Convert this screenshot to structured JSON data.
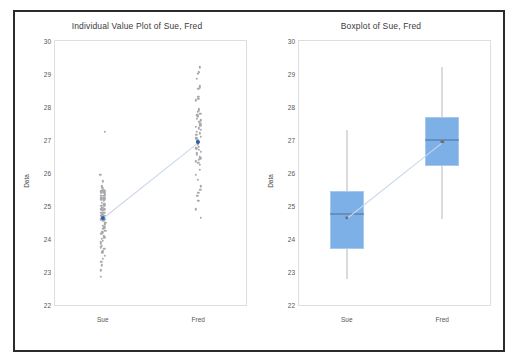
{
  "figure": {
    "panels": [
      {
        "id": "individual-value-plot",
        "title": "Individual Value Plot of Sue, Fred"
      },
      {
        "id": "boxplot",
        "title": "Boxplot of Sue, Fred"
      }
    ]
  },
  "chart_data": [
    {
      "type": "scatter",
      "title": "Individual Value Plot of Sue, Fred",
      "xlabel": "",
      "ylabel": "Data",
      "ylim": [
        22,
        30
      ],
      "yticks": [
        22,
        23,
        24,
        25,
        26,
        27,
        28,
        29,
        30
      ],
      "categories": [
        "Sue",
        "Fred"
      ],
      "grid": false,
      "legend": "none",
      "series": [
        {
          "name": "Sue",
          "mean": 24.65,
          "values": [
            27.25,
            25.95,
            25.75,
            25.6,
            25.55,
            25.5,
            25.45,
            25.45,
            25.4,
            25.4,
            25.35,
            25.3,
            25.3,
            25.25,
            25.25,
            25.2,
            25.2,
            25.15,
            25.1,
            25.05,
            25.0,
            25.0,
            24.95,
            24.9,
            24.9,
            24.85,
            24.8,
            24.8,
            24.75,
            24.7,
            24.7,
            24.65,
            24.6,
            24.6,
            24.55,
            24.5,
            24.45,
            24.4,
            24.35,
            24.3,
            24.25,
            24.2,
            24.15,
            24.1,
            24.05,
            24.0,
            23.95,
            23.9,
            23.85,
            23.8,
            23.75,
            23.7,
            23.65,
            23.6,
            23.5,
            23.4,
            23.3,
            23.2,
            23.05,
            22.85
          ]
        },
        {
          "name": "Fred",
          "mean": 26.95,
          "values": [
            29.2,
            29.05,
            29.0,
            28.85,
            28.65,
            28.6,
            28.55,
            28.3,
            28.25,
            28.2,
            27.95,
            27.9,
            27.85,
            27.8,
            27.75,
            27.7,
            27.65,
            27.6,
            27.55,
            27.5,
            27.45,
            27.4,
            27.35,
            27.3,
            27.25,
            27.2,
            27.15,
            27.1,
            27.05,
            27.0,
            26.95,
            26.9,
            26.85,
            26.8,
            26.75,
            26.7,
            26.65,
            26.6,
            26.55,
            26.5,
            26.45,
            26.4,
            26.35,
            26.3,
            26.25,
            26.1,
            25.95,
            25.8,
            25.6,
            25.5,
            25.4,
            25.3,
            25.15,
            24.9,
            24.65
          ]
        }
      ]
    },
    {
      "type": "boxplot",
      "title": "Boxplot of Sue, Fred",
      "xlabel": "",
      "ylabel": "Data",
      "ylim": [
        22,
        30
      ],
      "yticks": [
        22,
        23,
        24,
        25,
        26,
        27,
        28,
        29,
        30
      ],
      "categories": [
        "Sue",
        "Fred"
      ],
      "grid": false,
      "legend": "none",
      "boxes": [
        {
          "name": "Sue",
          "whisker_low": 22.8,
          "q1": 23.7,
          "median": 24.75,
          "q3": 25.45,
          "whisker_high": 27.3,
          "mean": 24.65
        },
        {
          "name": "Fred",
          "whisker_low": 24.6,
          "q1": 26.2,
          "median": 27.0,
          "q3": 27.7,
          "whisker_high": 29.2,
          "mean": 26.95
        }
      ],
      "connect_means": true
    }
  ],
  "colors": {
    "box_fill": "#7EB0E8",
    "box_edge": "#A8C9EE",
    "dot": "#A7A9AC",
    "mean_dot": "#2A5FA8",
    "median_line": "#4A6E9C",
    "whisker": "#B8B8B8",
    "connect_line": "#C9D7EA",
    "frame": "#2B2B2B",
    "plot_border": "#DEDEDE",
    "text": "#565656"
  }
}
